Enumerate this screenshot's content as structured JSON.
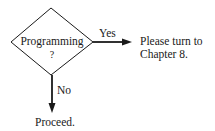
{
  "flowchart": {
    "decision": {
      "shape": "diamond",
      "label_line1": "Programming",
      "label_line2": "?"
    },
    "branches": {
      "yes": {
        "label": "Yes",
        "target_line1": "Please turn to",
        "target_line2": "Chapter 8."
      },
      "no": {
        "label": "No",
        "target": "Proceed."
      }
    },
    "colors": {
      "stroke": "#1a1a1a",
      "background": "#ffffff"
    }
  }
}
